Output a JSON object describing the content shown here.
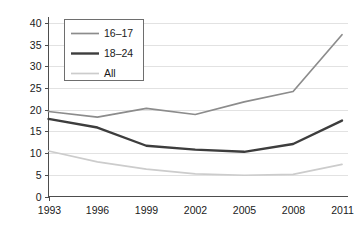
{
  "chart_data": {
    "type": "line",
    "title": "",
    "subtitle": "",
    "xlabel": "",
    "ylabel": "",
    "categories": [
      "1993",
      "1996",
      "1999",
      "2002",
      "2005",
      "2008",
      "2011"
    ],
    "x": [
      1993,
      1996,
      1999,
      2002,
      2005,
      2008,
      2011
    ],
    "xlim": [
      1993,
      2011
    ],
    "ylim": [
      0,
      40
    ],
    "yticks": [
      0,
      5,
      10,
      15,
      20,
      25,
      30,
      35,
      40
    ],
    "ytick_labels": [
      "0",
      "5",
      "10",
      "15",
      "20",
      "25",
      "30",
      "35",
      "40"
    ],
    "xtick_labels": [
      "1993",
      "1996",
      "1999",
      "2002",
      "2005",
      "2008",
      "2011"
    ],
    "grid": "horizontal",
    "legend_position": "top-left-inside",
    "series": [
      {
        "name": "16–17",
        "color": "#8c8c8c",
        "stroke_width": 1.7,
        "values": [
          19.6,
          18.3,
          20.3,
          18.9,
          21.8,
          24.2,
          37.3
        ]
      },
      {
        "name": "18–24",
        "color": "#3d3d3d",
        "stroke_width": 2.4,
        "values": [
          17.9,
          15.9,
          11.7,
          10.8,
          10.3,
          12.1,
          17.5
        ]
      },
      {
        "name": "All",
        "color": "#cccccc",
        "stroke_width": 1.7,
        "values": [
          10.5,
          8.0,
          6.3,
          5.2,
          4.9,
          5.1,
          7.4
        ]
      }
    ],
    "annotations": []
  },
  "legend": {
    "entries": [
      {
        "label": "16–17"
      },
      {
        "label": "18–24"
      },
      {
        "label": "All"
      }
    ]
  },
  "colors": {
    "axis": "#4d4d4d",
    "grid": "#e2e2e2",
    "text": "#1a1a1a",
    "background": "#ffffff",
    "legend_border": "#6e6e6e"
  }
}
